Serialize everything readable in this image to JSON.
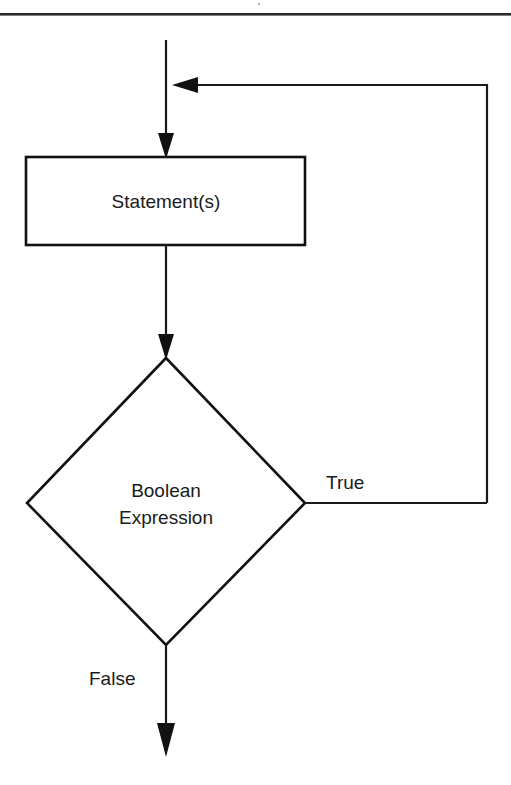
{
  "page": {
    "background_color": "#ffffff",
    "stroke_color": "#111111",
    "text_color": "#1a1a1a",
    "rule_color": "#2b2b2b",
    "width": 511,
    "height": 785
  },
  "diagram": {
    "kind": "flowchart",
    "top_rule_label": "",
    "nodes": [
      {
        "id": "statement",
        "shape": "rectangle",
        "label": "Statement(s)",
        "x": 26,
        "y": 157,
        "width": 279,
        "height": 88,
        "center_x": 166,
        "center_y": 201
      },
      {
        "id": "condition",
        "shape": "diamond",
        "label_line_1": "Boolean",
        "label_line_2": "Expression",
        "apex_x": 166,
        "apex_y": 358,
        "left_x": 27,
        "right_x": 305,
        "mid_y": 503,
        "bottom_y": 645
      }
    ],
    "edges": [
      {
        "id": "entry",
        "from": "",
        "to": "statement",
        "label": "",
        "arrowhead": "down"
      },
      {
        "id": "loop-back",
        "from": "condition",
        "to": "entry",
        "label": "",
        "arrowhead": "left"
      },
      {
        "id": "statement-to-condition",
        "from": "statement",
        "to": "condition",
        "label": "",
        "arrowhead": "down"
      },
      {
        "id": "true-branch",
        "from": "condition",
        "to": "loop-back",
        "label": "True",
        "arrowhead": "none"
      },
      {
        "id": "false-branch",
        "from": "condition",
        "to": "",
        "label": "False",
        "arrowhead": "down"
      }
    ]
  }
}
